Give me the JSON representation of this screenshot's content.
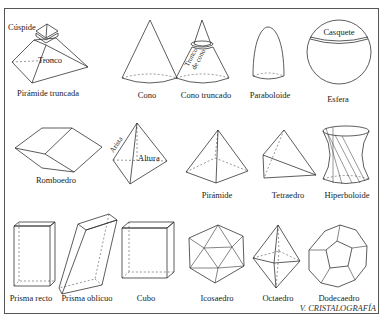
{
  "figure": {
    "footer": "V. CRISTALOGRAFÍA",
    "row1": {
      "piramide_truncada": {
        "label": "Pirámide truncada",
        "cuspide": "Cúspide",
        "tronco": "Tronco"
      },
      "cono": {
        "label": "Cono"
      },
      "cono_truncado": {
        "label": "Cono truncado",
        "tronco_de_cono_1": "Tronco",
        "tronco_de_cono_2": "de cono"
      },
      "paraboloide": {
        "label": "Paraboloide"
      },
      "esfera": {
        "label": "Esfera",
        "casquete": "Casquete"
      }
    },
    "row2": {
      "romboedro": {
        "label": "Romboedro"
      },
      "arista_altura": {
        "arista": "Arista",
        "altura": "Altura"
      },
      "piramide": {
        "label": "Pirámide"
      },
      "tetraedro": {
        "label": "Tetraedro"
      },
      "hiperboloide": {
        "label": "Hiperboloide"
      }
    },
    "row3": {
      "prisma_recto": {
        "label": "Prisma recto"
      },
      "prisma_oblicuo": {
        "label": "Prisma oblicuo"
      },
      "cubo": {
        "label": "Cubo"
      },
      "icosaedro": {
        "label": "Icosaedro"
      },
      "octaedro": {
        "label": "Octaedro"
      },
      "dodecaedro": {
        "label": "Dodecaedro"
      }
    }
  }
}
